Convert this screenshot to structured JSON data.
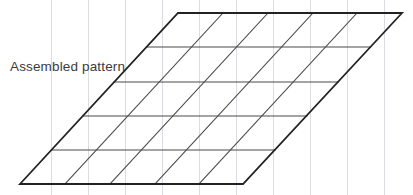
{
  "figure": {
    "title": "Assembled pattern",
    "label": {
      "text": "Assembled pattern",
      "x": 10,
      "y": 60,
      "color": "#3c3c3c"
    },
    "background_color": "#ffffff",
    "outline_color": "#222222",
    "grid_color": "#4a4a4a",
    "guide_color": "#d9dce0",
    "canvas": {
      "width": 413,
      "height": 195
    }
  },
  "chart_data": {
    "type": "diagram",
    "shape": "parallelogram-grid",
    "title": "Assembled pattern",
    "rows": 5,
    "columns": 5,
    "corners": {
      "top_left": [
        178,
        13
      ],
      "top_right": [
        402,
        13
      ],
      "bottom_right": [
        243,
        184
      ],
      "bottom_left": [
        20,
        184
      ]
    },
    "horizontal_line_y": [
      13,
      47,
      82,
      116,
      150,
      184
    ],
    "diagonal_top_x": [
      178,
      223,
      268,
      313,
      357,
      402
    ],
    "vertical_guide_x": [
      51,
      88,
      125,
      162,
      199,
      236,
      273,
      310,
      347,
      384
    ]
  }
}
